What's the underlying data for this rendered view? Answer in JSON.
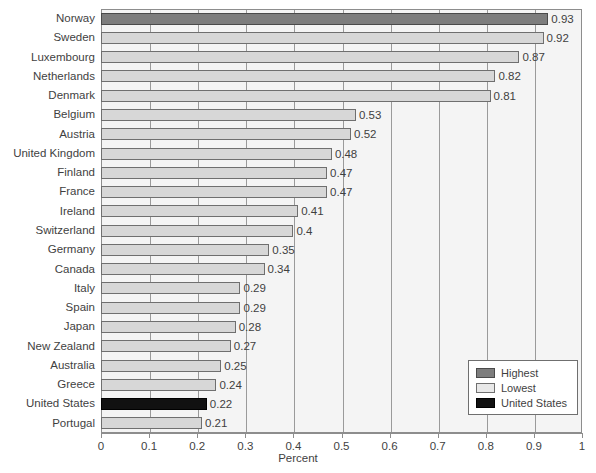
{
  "chart_data": {
    "type": "bar",
    "orientation": "horizontal",
    "title": "",
    "xlabel": "Percent",
    "ylabel": "",
    "xlim": [
      0,
      1
    ],
    "xticks": [
      "0",
      "0.1",
      "0.2",
      "0.3",
      "0.4",
      "0.5",
      "0.6",
      "0.7",
      "0.8",
      "0.9",
      "1"
    ],
    "grid": "vertical",
    "legend_position": "bottom-right",
    "categories": [
      "Norway",
      "Sweden",
      "Luxembourg",
      "Netherlands",
      "Denmark",
      "Belgium",
      "Austria",
      "United Kingdom",
      "Finland",
      "France",
      "Ireland",
      "Switzerland",
      "Germany",
      "Canada",
      "Italy",
      "Spain",
      "Japan",
      "New Zealand",
      "Australia",
      "Greece",
      "United States",
      "Portugal"
    ],
    "values": [
      0.93,
      0.92,
      0.87,
      0.82,
      0.81,
      0.53,
      0.52,
      0.48,
      0.47,
      0.47,
      0.41,
      0.4,
      0.35,
      0.34,
      0.29,
      0.29,
      0.28,
      0.27,
      0.25,
      0.24,
      0.22,
      0.21
    ],
    "value_labels": [
      "0.93",
      "0.92",
      "0.87",
      "0.82",
      "0.81",
      "0.53",
      "0.52",
      "0.48",
      "0.47",
      "0.47",
      "0.41",
      "0.4",
      "0.35",
      "0.34",
      "0.29",
      "0.29",
      "0.28",
      "0.27",
      "0.25",
      "0.24",
      "0.22",
      "0.21"
    ],
    "bar_classes": [
      "highest",
      "lowest",
      "lowest",
      "lowest",
      "lowest",
      "lowest",
      "lowest",
      "lowest",
      "lowest",
      "lowest",
      "lowest",
      "lowest",
      "lowest",
      "lowest",
      "lowest",
      "lowest",
      "lowest",
      "lowest",
      "lowest",
      "lowest",
      "us",
      "lowest"
    ],
    "legend": [
      {
        "label": "Highest",
        "swatch": "highest",
        "color": "#7d7d7d"
      },
      {
        "label": "Lowest",
        "swatch": "lowest",
        "color": "#e8e8e8"
      },
      {
        "label": "United States",
        "swatch": "us",
        "color": "#111111"
      }
    ],
    "colors": {
      "highest": "#7d7d7d",
      "lowest": "#d7d7d7",
      "united_states": "#111111",
      "plot_background": "#f4f4f4",
      "gridline": "#9a9a9a",
      "axis": "#8d8d8d",
      "text": "#3f3f3f"
    }
  }
}
